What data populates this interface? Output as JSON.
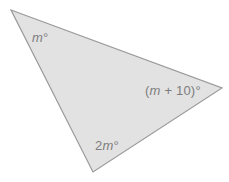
{
  "figure": {
    "type": "triangle-angle-diagram",
    "canvas": {
      "width": 229,
      "height": 182,
      "background": "#ffffff"
    },
    "shape": {
      "name": "triangle",
      "fill": "#e2e2e2",
      "stroke": "#9a9a9a",
      "stroke_width": 1.2,
      "points": "11,10 222,88 93,172",
      "vertices": [
        {
          "id": "top-left",
          "x": 11,
          "y": 10
        },
        {
          "id": "right",
          "x": 222,
          "y": 88
        },
        {
          "id": "bottom",
          "x": 93,
          "y": 172
        }
      ]
    },
    "labels": {
      "top_left_angle": {
        "variable": "m",
        "degree_symbol": "°",
        "text": "m°"
      },
      "right_angle": {
        "open_paren": "(",
        "variable": "m",
        "operator": "+",
        "constant": "10",
        "close_paren": ")",
        "degree_symbol": "°",
        "text": "(m + 10)°"
      },
      "bottom_angle": {
        "coefficient": "2",
        "variable": "m",
        "degree_symbol": "°",
        "text": "2m°"
      }
    },
    "colors": {
      "fill": "#e2e2e2",
      "stroke": "#9a9a9a",
      "label_text": "#7d7d7d",
      "background": "#ffffff"
    }
  }
}
